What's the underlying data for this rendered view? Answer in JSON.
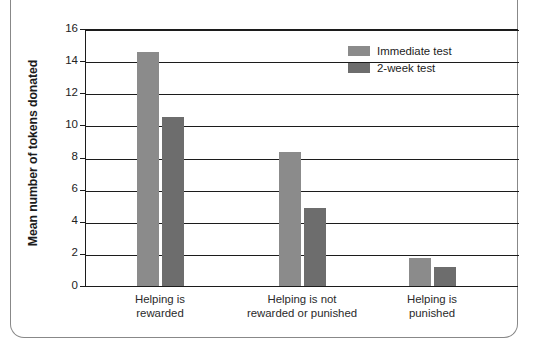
{
  "chart_data": {
    "type": "bar",
    "title": "",
    "xlabel": "",
    "ylabel": "Mean number of tokens donated",
    "ylim": [
      0,
      16
    ],
    "ytick_step": 2,
    "grid": true,
    "legend_position": "top-right",
    "categories": [
      "Helping is rewarded",
      "Helping is not rewarded or punished",
      "Helping is punished"
    ],
    "category_lines": [
      [
        "Helping is",
        "rewarded"
      ],
      [
        "Helping is not",
        "rewarded or punished"
      ],
      [
        "Helping is",
        "punished"
      ]
    ],
    "series": [
      {
        "name": "Immediate test",
        "color": "#8b8b8b",
        "values": [
          14.6,
          8.35,
          1.75
        ]
      },
      {
        "name": "2-week test",
        "color": "#6d6d6d",
        "values": [
          10.55,
          4.85,
          1.2
        ]
      }
    ],
    "ytick_labels": [
      "16",
      "14",
      "12",
      "10",
      "8",
      "6",
      "4",
      "2",
      "0"
    ],
    "ytick_values": [
      16,
      14,
      12,
      10,
      8,
      6,
      4,
      2,
      0
    ]
  },
  "axis": {
    "y_title": "Mean number of tokens donated"
  },
  "legend": {
    "items": [
      {
        "label": "Immediate test",
        "color": "#8b8b8b"
      },
      {
        "label": "2-week test",
        "color": "#6d6d6d"
      }
    ]
  },
  "colors": {
    "immediate": "#8b8b8b",
    "two_week": "#6d6d6d",
    "axis": "#1c1c1c",
    "frame": "#888888",
    "background": "#ffffff"
  }
}
